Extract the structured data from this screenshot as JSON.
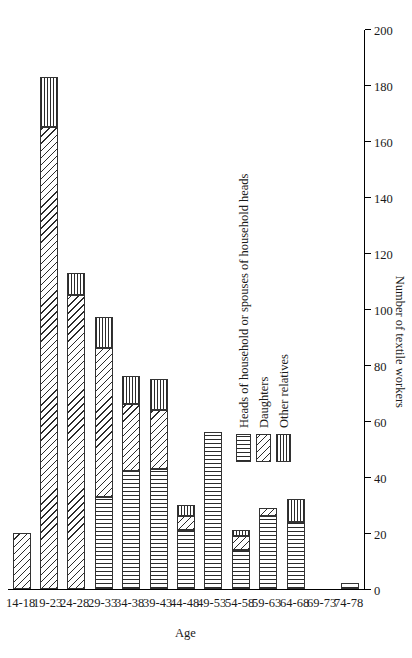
{
  "chart_data": {
    "type": "bar",
    "orientation": "vertical-stacked",
    "title": "",
    "xlabel": "Age",
    "ylabel": "Number of textile workers",
    "ylim": [
      0,
      200
    ],
    "ytick_step": 20,
    "yticks": [
      "200",
      "180",
      "160",
      "140",
      "120",
      "100",
      "80",
      "60",
      "40",
      "20",
      "0"
    ],
    "grid": false,
    "legend_position": "upper-left-inside",
    "categories": [
      "14-18",
      "19-23",
      "24-28",
      "29-33",
      "34-38",
      "39-43",
      "44-48",
      "49-53",
      "54-58",
      "59-63",
      "64-68",
      "69-73",
      "74-78"
    ],
    "series": [
      {
        "name": "Heads of household or spouses of household heads",
        "pattern": "vertical-lines-wide",
        "values": [
          0,
          0,
          0,
          33,
          42,
          43,
          21,
          56,
          14,
          26,
          24,
          0,
          2
        ]
      },
      {
        "name": "Daughters",
        "pattern": "diagonal-hatch",
        "values": [
          20,
          165,
          105,
          53,
          24,
          21,
          5,
          0,
          5,
          3,
          0,
          0,
          0
        ]
      },
      {
        "name": "Other relatives",
        "pattern": "vertical-lines-dense",
        "values": [
          0,
          18,
          8,
          11,
          10,
          11,
          4,
          0,
          2,
          0,
          8,
          0,
          0
        ]
      }
    ],
    "totals": [
      20,
      183,
      113,
      97,
      76,
      75,
      30,
      56,
      21,
      29,
      32,
      0,
      2
    ]
  },
  "legend": {
    "items": [
      {
        "label": "Heads of household or spouses of household heads"
      },
      {
        "label": "Daughters"
      },
      {
        "label": "Other relatives"
      }
    ]
  },
  "axes": {
    "value_axis_title": "Number of textile workers",
    "category_axis_title": "Age"
  }
}
